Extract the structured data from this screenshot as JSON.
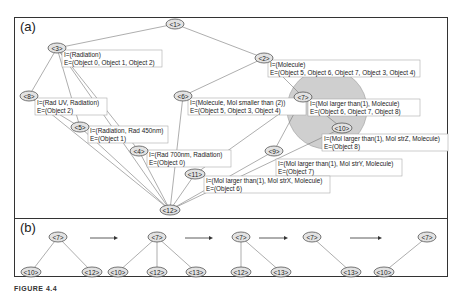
{
  "figure": {
    "panel_a_label": "(a)",
    "panel_b_label": "(b)",
    "caption": "FIGURE 4.4"
  },
  "lattice": {
    "nodes": [
      {
        "id": "<1>",
        "x": 175,
        "y": 24
      },
      {
        "id": "<2>",
        "x": 264,
        "y": 58
      },
      {
        "id": "<3>",
        "x": 57,
        "y": 48
      },
      {
        "id": "<6>",
        "x": 183,
        "y": 96
      },
      {
        "id": "<7>",
        "x": 303,
        "y": 97
      },
      {
        "id": "<8>",
        "x": 29,
        "y": 96
      },
      {
        "id": "<5>",
        "x": 80,
        "y": 127
      },
      {
        "id": "<10>",
        "x": 342,
        "y": 128
      },
      {
        "id": "<4>",
        "x": 139,
        "y": 151
      },
      {
        "id": "<9>",
        "x": 274,
        "y": 151
      },
      {
        "id": "<11>",
        "x": 195,
        "y": 174
      },
      {
        "id": "<12>",
        "x": 170,
        "y": 210
      }
    ],
    "info_boxes": [
      {
        "node": "<3>",
        "x": 62,
        "y": 50,
        "w": 100,
        "intent": "I=(Radiation)",
        "extent": "E=(Object 0, Object 1, Object 2)"
      },
      {
        "node": "<2>",
        "x": 268,
        "y": 60,
        "w": 152,
        "intent": "I=(Molecule)",
        "extent": "E=(Object 5, Object 6, Object 7, Object 3, Object 4)"
      },
      {
        "node": "<8>",
        "x": 35,
        "y": 98,
        "w": 72,
        "intent": "I=(Rad UV, Radiation)",
        "extent": "E=(Object 2)"
      },
      {
        "node": "<6>",
        "x": 188,
        "y": 98,
        "w": 118,
        "intent": "I=(Molecule, Mol smaller than (2))",
        "extent": "E=(Object 5, Object 3, Object 4)"
      },
      {
        "node": "<7>",
        "x": 308,
        "y": 99,
        "w": 112,
        "intent": "I=(Mol larger than(1), Molecule)",
        "extent": "E=(Object 6, Object 7, Object 8)"
      },
      {
        "node": "<5>",
        "x": 88,
        "y": 126,
        "w": 80,
        "intent": "I=(Radiation, Rad 450nm)",
        "extent": "E=(Object 1)"
      },
      {
        "node": "<10>",
        "x": 322,
        "y": 134,
        "w": 126,
        "intent": "I=(Mol larger than(1), Mol strZ, Molecule)",
        "extent": "E=(Object 8)"
      },
      {
        "node": "<4>",
        "x": 147,
        "y": 150,
        "w": 84,
        "intent": "I=(Rad 700nm, Radiation)",
        "extent": "E=(Object 0)"
      },
      {
        "node": "<9>",
        "x": 276,
        "y": 159,
        "w": 126,
        "intent": "I=(Mol larger than(1), Mol strY, Molecule)",
        "extent": "E=(Object 7)"
      },
      {
        "node": "<11>",
        "x": 204,
        "y": 176,
        "w": 126,
        "intent": "I=(Mol larger than(1), Mol strX, Molecule)",
        "extent": "E=(Object 6)"
      }
    ],
    "edges": [
      [
        "<1>",
        "<3>"
      ],
      [
        "<1>",
        "<2>"
      ],
      [
        "<3>",
        "<8>"
      ],
      [
        "<3>",
        "<5>"
      ],
      [
        "<3>",
        "<4>"
      ],
      [
        "<2>",
        "<6>"
      ],
      [
        "<2>",
        "<7>"
      ],
      [
        "<8>",
        "<12>"
      ],
      [
        "<5>",
        "<12>"
      ],
      [
        "<4>",
        "<12>"
      ],
      [
        "<6>",
        "<12>"
      ],
      [
        "<7>",
        "<10>"
      ],
      [
        "<7>",
        "<9>"
      ],
      [
        "<7>",
        "<11>"
      ],
      [
        "<10>",
        "<12>"
      ],
      [
        "<9>",
        "<12>"
      ],
      [
        "<11>",
        "<12>"
      ],
      [
        "<3>",
        "<12>"
      ],
      [
        "<8>",
        "<5>"
      ]
    ],
    "highlight_circle": {
      "cx": 327,
      "cy": 109,
      "r": 40,
      "color": "#cfcfcf"
    }
  },
  "sequence": {
    "steps": [
      {
        "root": "<7>",
        "rx": 58,
        "children": [
          {
            "id": "<10>",
            "x": 31
          },
          {
            "id": "<12>",
            "x": 92
          }
        ]
      },
      {
        "root": "<7>",
        "rx": 157,
        "children": [
          {
            "id": "<10>",
            "x": 118
          },
          {
            "id": "<12>",
            "x": 157
          },
          {
            "id": "<13>",
            "x": 196
          }
        ]
      },
      {
        "root": "<7>",
        "rx": 241,
        "children": [
          {
            "id": "<12>",
            "x": 241
          },
          {
            "id": "<13>",
            "x": 281
          }
        ]
      },
      {
        "root": "<7>",
        "rx": 312,
        "children": [
          {
            "id": "<13>",
            "x": 351
          }
        ]
      },
      {
        "root": "<7>",
        "rx": 427,
        "children": [
          {
            "id": "<10>",
            "x": 384
          }
        ]
      }
    ],
    "arrows": [
      {
        "x1": 90,
        "x2": 118
      },
      {
        "x1": 185,
        "x2": 213
      },
      {
        "x1": 259,
        "x2": 288
      },
      {
        "x1": 350,
        "x2": 382
      }
    ]
  }
}
